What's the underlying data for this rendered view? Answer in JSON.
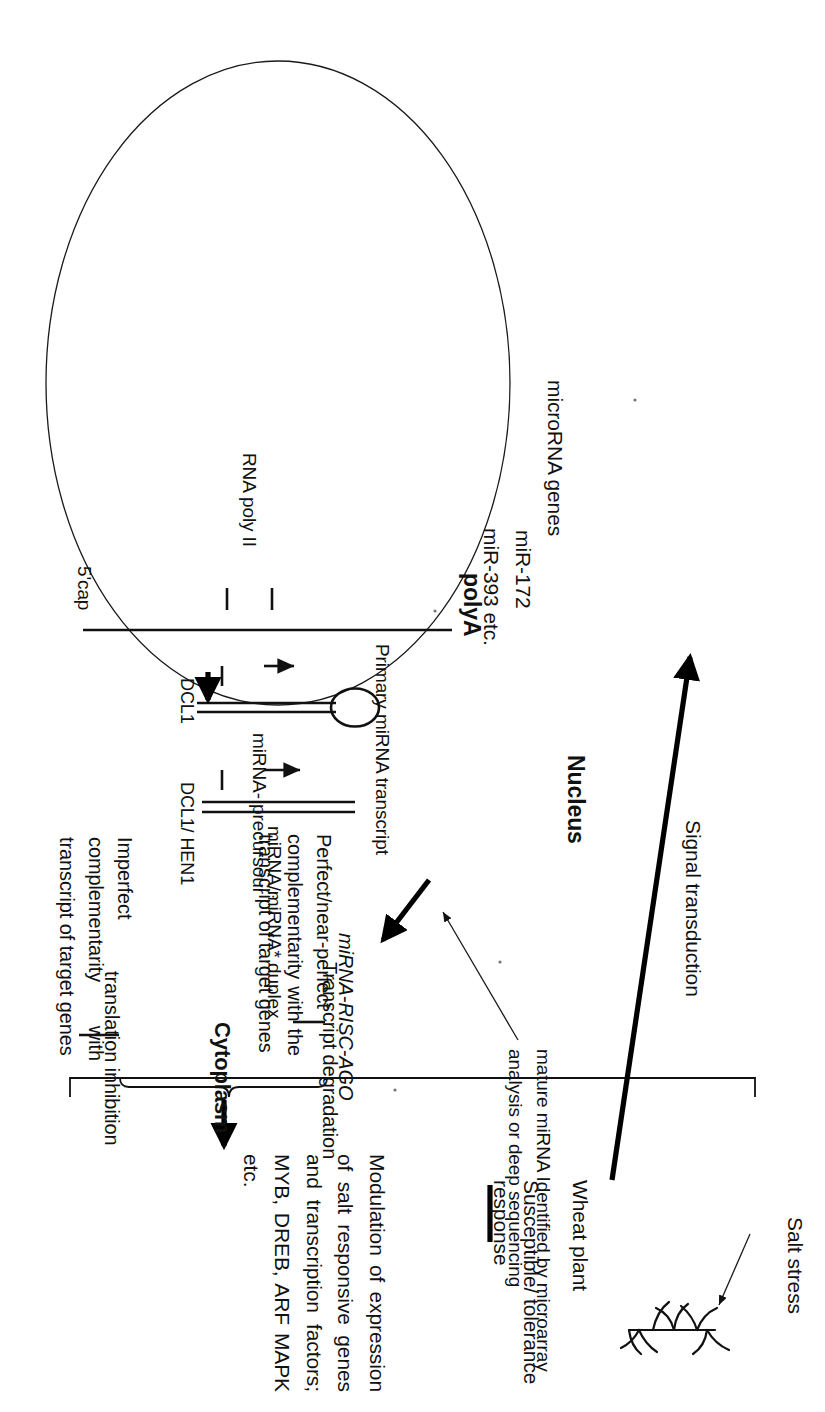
{
  "figure": {
    "title_implicit": "miRNA biogenesis and salt-stress response pathway in wheat",
    "nucleus_label": "Nucleus",
    "cytoplasm_label": "Cytoplasm",
    "nucleus": {
      "gene_label": "microRNA genes",
      "mirna_examples": [
        "miR-172",
        "miR-393 etc."
      ],
      "polymerase_label": "RNA poly II",
      "cap_label": "5'cap",
      "polya_label": "polyA",
      "primary_transcript_label": "Primary miRNA transcript",
      "enzyme_step1": "DCL1",
      "precursor_label": "miRNA- precursour",
      "enzyme_step2": "DCL1/ HEN1",
      "duplex_label": "miRNA/miRNA* duplex"
    },
    "annotation_detection": "mature miRNA Identified by microarray analysis or deep sequencing",
    "risc_label": "miRNA-RISC-AGO",
    "cytoplasm": {
      "branch_perfect": "Perfect/near-perfect complementarity with the transcript of target genes",
      "branch_imperfect": "Imperfect complementarity with transcript of target genes",
      "outcome_perfect": "Transcript degradation",
      "outcome_imperfect": "translation inhibition"
    },
    "downstream": {
      "modulation_text": "Modulation of expression of salt responsive genes and transcription factors; MYB, DREB, ARF MAPK etc."
    },
    "plant_side": {
      "stress_label": "Salt stress",
      "plant_label": "Wheat plant",
      "signal_label": "Signal transduction",
      "response_label": "Susceptible/ tolerance response"
    },
    "icons": {
      "nucleus_membrane": "ellipse-outline-icon",
      "hairpin": "rna-hairpin-icon",
      "duplex": "rna-duplex-icon",
      "wheat_plant": "wheat-plant-sketch-icon",
      "arrow_signal": "thick-up-arrow-icon",
      "arrow_export": "thick-export-arrow-icon",
      "arrow_small": "small-arrow-icon",
      "bracket_outcomes": "curly-bracket-icon",
      "bracket_cytoplasm": "square-bracket-icon"
    },
    "colors": {
      "ink": "#111111",
      "membrane": "#1a1a1a",
      "paper": "#ffffff"
    }
  }
}
